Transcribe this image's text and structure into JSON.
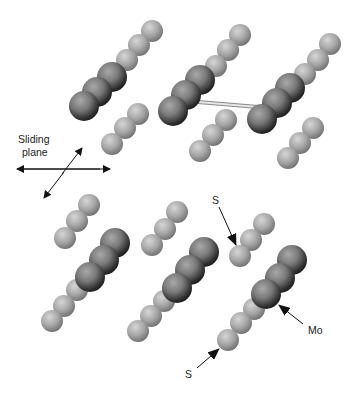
{
  "diagram": {
    "labels": {
      "sliding_line1": "Sliding",
      "sliding_line2": "plane",
      "s_top": "S",
      "s_bottom": "S",
      "mo": "Mo"
    },
    "colors": {
      "mo_light": "#9a9a9a",
      "mo_dark": "#1e1e1e",
      "s_light": "#cfcfcf",
      "s_dark": "#6a6a6a",
      "arrow": "#111111",
      "bond": "#b8b8b8"
    },
    "chains": [
      {
        "type": "S",
        "r": 11,
        "atoms": [
          [
            152,
            31
          ],
          [
            139,
            45
          ],
          [
            127,
            60
          ]
        ]
      },
      {
        "type": "Mo",
        "r": 15,
        "atoms": [
          [
            112,
            77
          ],
          [
            97,
            92
          ],
          [
            84,
            106
          ]
        ]
      },
      {
        "type": "S",
        "r": 11,
        "atoms": [
          [
            138,
            114
          ],
          [
            125,
            128
          ],
          [
            112,
            144
          ]
        ]
      },
      {
        "type": "S",
        "r": 11,
        "atoms": [
          [
            240,
            35
          ],
          [
            228,
            50
          ],
          [
            216,
            66
          ]
        ]
      },
      {
        "type": "Mo",
        "r": 15,
        "atoms": [
          [
            200,
            80
          ],
          [
            186,
            95
          ],
          [
            173,
            111
          ]
        ]
      },
      {
        "type": "S",
        "r": 11,
        "atoms": [
          [
            226,
            120
          ],
          [
            213,
            135
          ],
          [
            200,
            151
          ]
        ]
      },
      {
        "type": "S",
        "r": 11,
        "atoms": [
          [
            330,
            44
          ],
          [
            318,
            60
          ],
          [
            305,
            74
          ]
        ]
      },
      {
        "type": "Mo",
        "r": 15,
        "atoms": [
          [
            290,
            88
          ],
          [
            277,
            103
          ],
          [
            262,
            119
          ]
        ]
      },
      {
        "type": "S",
        "r": 11,
        "atoms": [
          [
            313,
            128
          ],
          [
            300,
            143
          ],
          [
            288,
            158
          ]
        ]
      },
      {
        "type": "S",
        "r": 11,
        "atoms": [
          [
            89,
            205
          ],
          [
            77,
            221
          ],
          [
            65,
            238
          ]
        ]
      },
      {
        "type": "S",
        "r": 11,
        "atoms": [
          [
            77,
            290
          ],
          [
            64,
            306
          ],
          [
            52,
            321
          ]
        ]
      },
      {
        "type": "Mo",
        "r": 15,
        "atoms": [
          [
            115,
            243
          ],
          [
            104,
            260
          ],
          [
            90,
            277
          ]
        ]
      },
      {
        "type": "S",
        "r": 11,
        "atoms": [
          [
            177,
            212
          ],
          [
            165,
            229
          ],
          [
            152,
            245
          ]
        ]
      },
      {
        "type": "S",
        "r": 11,
        "atoms": [
          [
            164,
            301
          ],
          [
            151,
            316
          ],
          [
            138,
            331
          ]
        ]
      },
      {
        "type": "Mo",
        "r": 15,
        "atoms": [
          [
            204,
            252
          ],
          [
            190,
            270
          ],
          [
            177,
            288
          ]
        ]
      },
      {
        "type": "S",
        "r": 11,
        "atoms": [
          [
            264,
            224
          ],
          [
            251,
            240
          ],
          [
            240,
            256
          ]
        ]
      },
      {
        "type": "S",
        "r": 11,
        "atoms": [
          [
            254,
            309
          ],
          [
            241,
            323
          ],
          [
            228,
            340
          ]
        ]
      },
      {
        "type": "Mo",
        "r": 15,
        "atoms": [
          [
            292,
            260
          ],
          [
            280,
            278
          ],
          [
            266,
            294
          ]
        ]
      }
    ],
    "bond": {
      "x1": 198,
      "y1": 102,
      "x2": 258,
      "y2": 107
    }
  }
}
